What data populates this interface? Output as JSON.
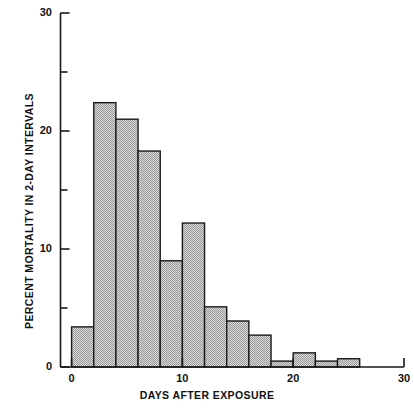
{
  "chart_data": {
    "type": "bar",
    "title": "",
    "subtitle": "",
    "xlabel": "DAYS AFTER EXPOSURE",
    "ylabel": "PERCENT MORTALITY IN 2-DAY INTERVALS",
    "xlim": [
      -1,
      30
    ],
    "ylim": [
      0,
      30
    ],
    "xticks": [
      0,
      10,
      20,
      30
    ],
    "xtick_labels": [
      "0",
      "10",
      "20",
      "30"
    ],
    "yticks": [
      0,
      5,
      10,
      15,
      20,
      25,
      30
    ],
    "ytick_labels": [
      "0",
      "",
      "10",
      "",
      "20",
      "",
      "30"
    ],
    "ytick_major": [
      0,
      10,
      20,
      30
    ],
    "grid": false,
    "legend": "none",
    "bin_width": 2,
    "bar_style": {
      "fill": "#c9c9c9",
      "edge": "#1a1a1a",
      "hatch": "fine-checker"
    },
    "categories": [
      "0-2",
      "2-4",
      "4-6",
      "6-8",
      "8-10",
      "10-12",
      "12-14",
      "14-16",
      "16-18",
      "18-20",
      "20-22",
      "22-24",
      "24-26",
      "26-28"
    ],
    "bin_starts": [
      0,
      2,
      4,
      6,
      8,
      10,
      12,
      14,
      16,
      18,
      20,
      22,
      24,
      26
    ],
    "values": [
      3.4,
      22.4,
      21.0,
      18.3,
      9.0,
      12.2,
      5.1,
      3.9,
      2.7,
      0.5,
      1.2,
      0.5,
      0.7,
      0.0
    ]
  },
  "axes": {
    "x_axis_name": "x-axis",
    "y_axis_name": "y-axis"
  }
}
